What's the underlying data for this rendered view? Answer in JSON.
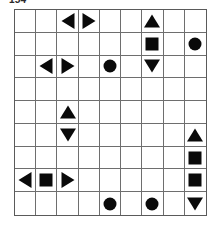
{
  "figure": {
    "number_label": "154"
  },
  "grid": {
    "rows": 9,
    "columns": 9,
    "line_color": "#6e6e6e",
    "border_color": "#5a5a5a",
    "background_color": "#ffffff",
    "symbol_color": "#0a0a0a",
    "symbol_names": {
      "square": "square-icon",
      "circle": "circle-icon",
      "tri-up": "triangle-up-icon",
      "tri-down": "triangle-down-icon",
      "tri-left": "triangle-left-icon",
      "tri-right": "triangle-right-icon"
    },
    "cells": [
      [
        "",
        "",
        "tri-left",
        "tri-right",
        "",
        "",
        "tri-up",
        "",
        ""
      ],
      [
        "",
        "",
        "",
        "",
        "",
        "",
        "square",
        "",
        "circle"
      ],
      [
        "",
        "tri-left",
        "tri-right",
        "",
        "circle",
        "",
        "tri-down",
        "",
        ""
      ],
      [
        "",
        "",
        "",
        "",
        "",
        "",
        "",
        "",
        ""
      ],
      [
        "",
        "",
        "tri-up",
        "",
        "",
        "",
        "",
        "",
        ""
      ],
      [
        "",
        "",
        "tri-down",
        "",
        "",
        "",
        "",
        "",
        "tri-up"
      ],
      [
        "",
        "",
        "",
        "",
        "",
        "",
        "",
        "",
        "square"
      ],
      [
        "tri-left",
        "square",
        "tri-right",
        "",
        "",
        "",
        "",
        "",
        "square"
      ],
      [
        "",
        "",
        "",
        "",
        "circle",
        "",
        "circle",
        "",
        "tri-down"
      ]
    ]
  }
}
